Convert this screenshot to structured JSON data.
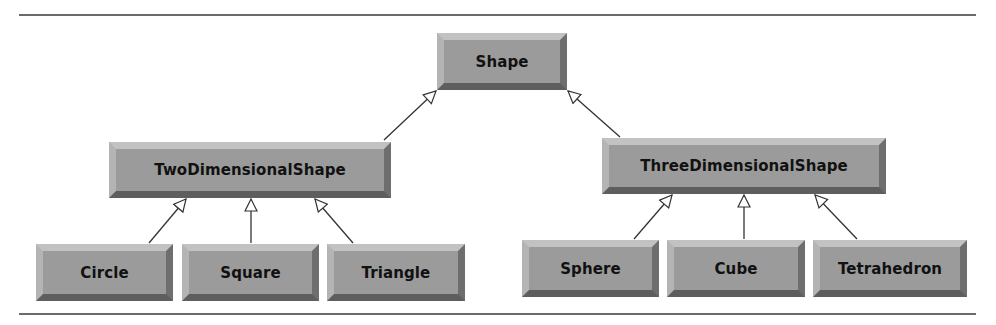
{
  "diagram": {
    "type": "class-inheritance-hierarchy",
    "root": {
      "id": "shape",
      "label": "Shape"
    },
    "level2": [
      {
        "id": "two-dimensional-shape",
        "label": "TwoDimensionalShape",
        "parent": "shape"
      },
      {
        "id": "three-dimensional-shape",
        "label": "ThreeDimensionalShape",
        "parent": "shape"
      }
    ],
    "level3": [
      {
        "id": "circle",
        "label": "Circle",
        "parent": "two-dimensional-shape"
      },
      {
        "id": "square",
        "label": "Square",
        "parent": "two-dimensional-shape"
      },
      {
        "id": "triangle",
        "label": "Triangle",
        "parent": "two-dimensional-shape"
      },
      {
        "id": "sphere",
        "label": "Sphere",
        "parent": "three-dimensional-shape"
      },
      {
        "id": "cube",
        "label": "Cube",
        "parent": "three-dimensional-shape"
      },
      {
        "id": "tetrahedron",
        "label": "Tetrahedron",
        "parent": "three-dimensional-shape"
      }
    ],
    "edges": [
      {
        "from": "two-dimensional-shape",
        "to": "shape",
        "arrow": "hollow-triangle"
      },
      {
        "from": "three-dimensional-shape",
        "to": "shape",
        "arrow": "hollow-triangle"
      },
      {
        "from": "circle",
        "to": "two-dimensional-shape",
        "arrow": "hollow-triangle"
      },
      {
        "from": "square",
        "to": "two-dimensional-shape",
        "arrow": "hollow-triangle"
      },
      {
        "from": "triangle",
        "to": "two-dimensional-shape",
        "arrow": "hollow-triangle"
      },
      {
        "from": "sphere",
        "to": "three-dimensional-shape",
        "arrow": "hollow-triangle"
      },
      {
        "from": "cube",
        "to": "three-dimensional-shape",
        "arrow": "hollow-triangle"
      },
      {
        "from": "tetrahedron",
        "to": "three-dimensional-shape",
        "arrow": "hollow-triangle"
      }
    ],
    "colors": {
      "box_fill": "#9b9b9b",
      "bevel_light": "#c2c2c2",
      "bevel_dark": "#5e5e5e",
      "text": "#111111",
      "line": "#333333",
      "rule": "#6a6a6a"
    }
  }
}
